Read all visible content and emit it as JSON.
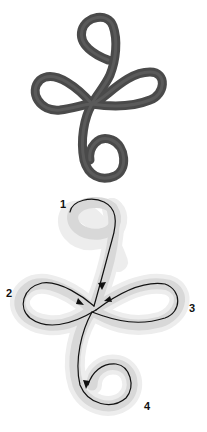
{
  "diagram": {
    "type": "ribbon-knot-illustration",
    "panels": [
      {
        "name": "finished-knot",
        "description": "Dark grey ribbon formed into a curl at top, figure-eight loops in the middle, and a curl at the bottom"
      },
      {
        "name": "path-guide",
        "description": "Light grey ribbon outline with black directional path line and arrows"
      }
    ],
    "step_labels": [
      "1",
      "2",
      "3",
      "4"
    ],
    "colors": {
      "ribbon_dark": "#4a4a4a",
      "ribbon_light": "#d8d8d8",
      "ribbon_shadow": "#ececec",
      "path_line": "#111111",
      "background": "#ffffff"
    }
  }
}
